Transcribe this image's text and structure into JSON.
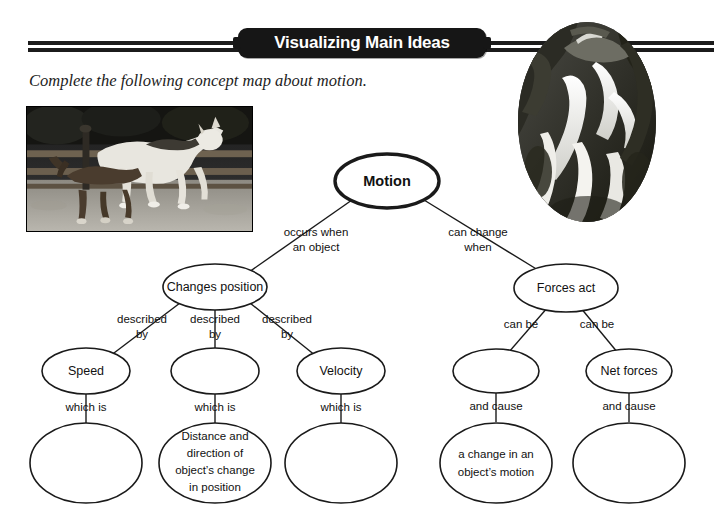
{
  "header": {
    "title": "Visualizing Main Ideas",
    "rule_color": "#1b1b1b",
    "pill_color": "#161616",
    "title_color": "#ffffff"
  },
  "instruction": "Complete the following concept map about motion.",
  "images": [
    {
      "name": "horse-photo",
      "caption": "black and white photograph of a white horse and foal running beside a wooden fence"
    },
    {
      "name": "waterfall-photo",
      "caption": "oval black and white photograph of a waterfall cascading over rocks"
    }
  ],
  "concept_map": {
    "nodes": {
      "motion": "Motion",
      "changes_position": "Changes position",
      "forces_act": "Forces act",
      "speed": "Speed",
      "blank_mid_left": "",
      "velocity": "Velocity",
      "blank_mid_right": "",
      "net_forces": "Net forces",
      "blank_bottom_1": "",
      "distance_direction_l1": "Distance and",
      "distance_direction_l2": "direction of",
      "distance_direction_l3": "object’s change",
      "distance_direction_l4": "in position",
      "blank_bottom_3": "",
      "change_motion_l1": "a change in an",
      "change_motion_l2": "object’s motion",
      "blank_bottom_5": ""
    },
    "edge_labels": {
      "occurs_when_l1": "occurs when",
      "occurs_when_l2": "an object",
      "can_change_l1": "can change",
      "can_change_l2": "when",
      "described_by_1_l1": "described",
      "described_by_1_l2": "by",
      "described_by_2_l1": "described",
      "described_by_2_l2": "by",
      "described_by_3_l1": "described",
      "described_by_3_l2": "by",
      "can_be_1": "can be",
      "can_be_2": "can be",
      "which_is_1": "which is",
      "which_is_2": "which is",
      "which_is_3": "which is",
      "and_cause_1": "and cause",
      "and_cause_2": "and cause"
    }
  }
}
